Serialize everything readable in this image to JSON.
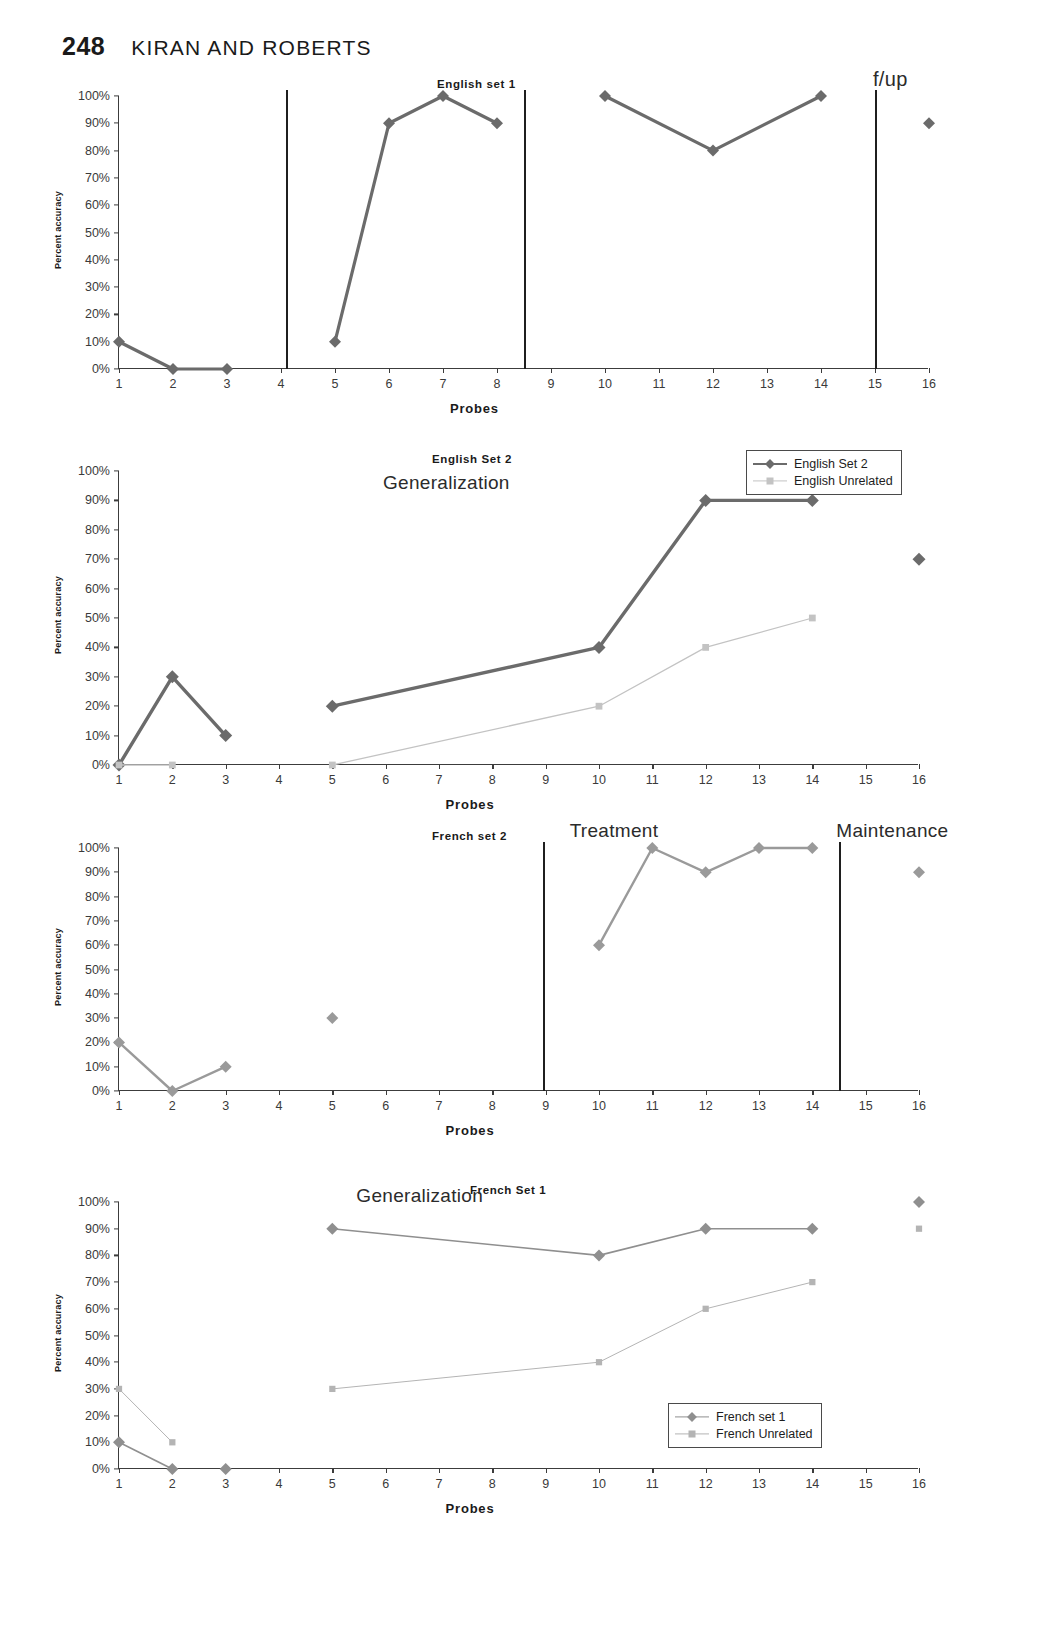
{
  "page": {
    "number": "248",
    "running_head": "KIRAN AND ROBERTS"
  },
  "common": {
    "xlabel": "Probes",
    "ylabel": "Percent accuracy",
    "yticks": [
      "100%",
      "90%",
      "80%",
      "70%",
      "60%",
      "50%",
      "40%",
      "30%",
      "20%",
      "10%",
      "0%"
    ],
    "xticks": [
      "1",
      "2",
      "3",
      "4",
      "5",
      "6",
      "7",
      "8",
      "9",
      "10",
      "11",
      "12",
      "13",
      "14",
      "15",
      "16"
    ],
    "colors": {
      "treated_series": "#6b6b6b",
      "untreated_series": "#c3c3c3",
      "axis": "#3c3c3c",
      "phase_line": "#1f1f1f"
    }
  },
  "panels": [
    {
      "id": "english-set-1",
      "title": "English set 1",
      "annotations": [
        {
          "text": "f/up"
        }
      ]
    },
    {
      "id": "english-set-2",
      "title": "English Set 2",
      "annotations": [
        {
          "text": "Generalization"
        }
      ],
      "legend": [
        {
          "label": "English Set 2",
          "marker": "diamond",
          "style": "thick"
        },
        {
          "label": "English Unrelated",
          "marker": "square",
          "style": "thin"
        }
      ]
    },
    {
      "id": "french-set-2",
      "title": "French set 2",
      "annotations": [
        {
          "text": "Treatment"
        },
        {
          "text": "Maintenance"
        }
      ]
    },
    {
      "id": "french-set-1",
      "title": "French Set 1",
      "annotations": [
        {
          "text": "Generalization"
        }
      ],
      "legend": [
        {
          "label": "French set 1",
          "marker": "diamond",
          "style": "thin"
        },
        {
          "label": "French  Unrelated",
          "marker": "square",
          "style": "thin"
        }
      ]
    }
  ],
  "chart_data": [
    {
      "type": "line",
      "title": "English set 1",
      "xlabel": "Probes",
      "ylabel": "Percent accuracy",
      "ylim": [
        0,
        100
      ],
      "xlim": [
        1,
        16
      ],
      "grid": false,
      "legend": "none",
      "annotations": [
        {
          "text": "f/up",
          "x": 16,
          "y": 100
        }
      ],
      "phase_lines_x": [
        4.1,
        8.5,
        15.0
      ],
      "series": [
        {
          "name": "English set 1",
          "marker": "diamond",
          "color": "#6b6b6b",
          "segments": [
            {
              "x": [
                1,
                2,
                3
              ],
              "y": [
                10,
                0,
                0
              ]
            },
            {
              "x": [
                5,
                6,
                7,
                8
              ],
              "y": [
                10,
                90,
                100,
                90
              ]
            },
            {
              "x": [
                10,
                12,
                14
              ],
              "y": [
                100,
                80,
                100
              ]
            },
            {
              "x": [
                16
              ],
              "y": [
                90
              ]
            }
          ]
        }
      ]
    },
    {
      "type": "line",
      "title": "English Set 2",
      "xlabel": "Probes",
      "ylabel": "Percent accuracy",
      "ylim": [
        0,
        100
      ],
      "xlim": [
        1,
        16
      ],
      "grid": false,
      "legend": "top-right",
      "annotations": [
        {
          "text": "Generalization",
          "x": 7,
          "y": 90
        }
      ],
      "phase_lines_x": [],
      "series": [
        {
          "name": "English Set 2",
          "marker": "diamond",
          "color": "#6b6b6b",
          "segments": [
            {
              "x": [
                1,
                2,
                3
              ],
              "y": [
                0,
                30,
                10
              ]
            },
            {
              "x": [
                5,
                10,
                12,
                14
              ],
              "y": [
                20,
                40,
                90,
                90
              ]
            },
            {
              "x": [
                16
              ],
              "y": [
                70
              ]
            }
          ]
        },
        {
          "name": "English Unrelated",
          "marker": "square",
          "color": "#c3c3c3",
          "segments": [
            {
              "x": [
                1,
                2
              ],
              "y": [
                0,
                0
              ]
            },
            {
              "x": [
                5,
                10,
                12,
                14
              ],
              "y": [
                0,
                20,
                40,
                50
              ]
            }
          ]
        }
      ]
    },
    {
      "type": "line",
      "title": "French set 2",
      "xlabel": "Probes",
      "ylabel": "Percent accuracy",
      "ylim": [
        0,
        100
      ],
      "xlim": [
        1,
        16
      ],
      "grid": false,
      "legend": "none",
      "annotations": [
        {
          "text": "Treatment",
          "x": 10.5,
          "y": 105
        },
        {
          "text": "Maintenance",
          "x": 15.5,
          "y": 105
        }
      ],
      "phase_lines_x": [
        8.95,
        14.5
      ],
      "series": [
        {
          "name": "French set 2",
          "marker": "diamond",
          "color": "#9a9a9a",
          "segments": [
            {
              "x": [
                1,
                2,
                3
              ],
              "y": [
                20,
                0,
                10
              ]
            },
            {
              "x": [
                5
              ],
              "y": [
                30
              ]
            },
            {
              "x": [
                10,
                11,
                12,
                13,
                14
              ],
              "y": [
                60,
                100,
                90,
                100,
                100
              ]
            },
            {
              "x": [
                16
              ],
              "y": [
                90
              ]
            }
          ]
        }
      ]
    },
    {
      "type": "line",
      "title": "French Set 1",
      "xlabel": "Probes",
      "ylabel": "Percent accuracy",
      "ylim": [
        0,
        100
      ],
      "xlim": [
        1,
        16
      ],
      "grid": false,
      "legend": "bottom-right",
      "annotations": [
        {
          "text": "Generalization",
          "x": 6.5,
          "y": 96
        }
      ],
      "phase_lines_x": [],
      "series": [
        {
          "name": "French set 1",
          "marker": "diamond",
          "color": "#8f8f8f",
          "segments": [
            {
              "x": [
                1,
                2
              ],
              "y": [
                10,
                0
              ]
            },
            {
              "x": [
                3
              ],
              "y": [
                0
              ]
            },
            {
              "x": [
                5,
                10,
                12,
                14
              ],
              "y": [
                90,
                80,
                90,
                90
              ]
            },
            {
              "x": [
                16
              ],
              "y": [
                100
              ]
            }
          ]
        },
        {
          "name": "French  Unrelated",
          "marker": "square",
          "color": "#b4b4b4",
          "segments": [
            {
              "x": [
                1,
                2
              ],
              "y": [
                30,
                10
              ]
            },
            {
              "x": [
                5,
                10,
                12,
                14
              ],
              "y": [
                30,
                40,
                60,
                70
              ]
            },
            {
              "x": [
                16
              ],
              "y": [
                90
              ]
            }
          ]
        }
      ]
    }
  ]
}
